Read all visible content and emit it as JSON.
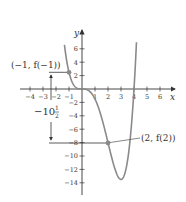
{
  "figure": {
    "axis_labels": {
      "x": "x",
      "y": "y"
    },
    "x_ticks": [
      {
        "value": -4,
        "label": "-4"
      },
      {
        "value": -3,
        "label": "-3"
      },
      {
        "value": -2,
        "label": "-2"
      },
      {
        "value": -1,
        "label": "-1"
      },
      {
        "value": 1,
        "label": "1"
      },
      {
        "value": 2,
        "label": "2"
      },
      {
        "value": 3,
        "label": "3"
      },
      {
        "value": 4,
        "label": "4"
      },
      {
        "value": 5,
        "label": "5"
      },
      {
        "value": 6,
        "label": "6"
      }
    ],
    "y_ticks": [
      {
        "value": 6,
        "label": "6"
      },
      {
        "value": 4,
        "label": "4"
      },
      {
        "value": 2,
        "label": "2"
      },
      {
        "value": -2,
        "label": "-2"
      },
      {
        "value": -4,
        "label": "-4"
      },
      {
        "value": -6,
        "label": "-6"
      },
      {
        "value": -8,
        "label": "-8"
      },
      {
        "value": -10,
        "label": "-10"
      },
      {
        "value": -12,
        "label": "-12"
      },
      {
        "value": -14,
        "label": "-14"
      }
    ],
    "annotations": {
      "point_a": "(−1, f(−1))",
      "point_b": "(2, f(2))",
      "difference_whole": "−10",
      "difference_num": "1",
      "difference_den": "2"
    },
    "colors": {
      "curve": "#8a8a8a",
      "axis": "#333333",
      "points": "#8a8a8a"
    }
  },
  "chart_data": {
    "type": "line",
    "title": "",
    "xlabel": "x",
    "ylabel": "y",
    "xlim": [
      -4.5,
      7
    ],
    "ylim": [
      -15,
      7.5
    ],
    "grid": false,
    "function": "f(x) = 0.5x^4 - 2x^3",
    "series": [
      {
        "name": "f(x)",
        "x": [
          -1.35,
          -1,
          -0.5,
          0,
          0.5,
          1,
          1.5,
          2,
          2.5,
          3,
          3.5,
          4,
          4.2
        ],
        "values": [
          6.0,
          2.5,
          0.28,
          0,
          -0.22,
          -1.5,
          -4.22,
          -8,
          -11.72,
          -13.5,
          -10.72,
          0,
          6.05
        ]
      }
    ],
    "highlighted_points": [
      {
        "x": -1,
        "y": 2.5,
        "label": "(−1, f(−1))"
      },
      {
        "x": 2,
        "y": -8,
        "label": "(2, f(2))"
      }
    ],
    "annotations": [
      {
        "text": "−10½",
        "meaning": "vertical change f(2) − f(−1)"
      }
    ]
  }
}
